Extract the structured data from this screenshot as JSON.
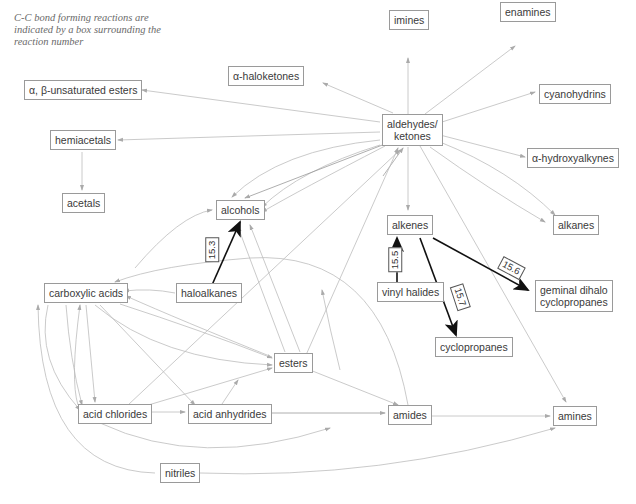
{
  "note": "C-C bond forming reactions are indicated by a box surrounding the reaction number",
  "nodes": {
    "imines": "imines",
    "enamines": "enamines",
    "haloketones": "α-haloketones",
    "unsat_esters": "α, β-unsaturated esters",
    "cyanohydrins": "cyanohydrins",
    "aldehydes_1": "aldehydes/",
    "aldehydes_2": "ketones",
    "hemiacetals": "hemiacetals",
    "hydroxyalkynes": "α-hydroxyalkynes",
    "acetals": "acetals",
    "alcohols": "alcohols",
    "alkenes": "alkenes",
    "alkanes": "alkanes",
    "carboxylic_acids": "carboxylic acids",
    "haloalkanes": "haloalkanes",
    "vinyl_halides": "vinyl halides",
    "geminal_1": "geminal dihalo",
    "geminal_2": "cyclopropanes",
    "cyclopropanes": "cyclopropanes",
    "esters": "esters",
    "acid_chlorides": "acid chlorides",
    "acid_anhydrides": "acid anhydrides",
    "amides": "amides",
    "amines": "amines",
    "nitriles": "nitriles"
  },
  "reactions": {
    "r153": "15.3",
    "r155": "15.5",
    "r156": "15.6",
    "r157": "15.7"
  },
  "colors": {
    "edge": "#b8b8b8",
    "bold_edge": "#111111",
    "node_border": "#9a9a9a"
  }
}
